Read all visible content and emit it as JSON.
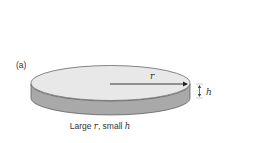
{
  "figure": {
    "panel_label": "(a)",
    "radius_label": "r",
    "height_label": "h",
    "caption": {
      "prefix": "Large ",
      "var1": "r",
      "middle": ", small ",
      "var2": "h"
    },
    "colors": {
      "top_face": "#e8e8e8",
      "side_band": "#a9a9a9",
      "outline": "#555555",
      "arrow": "#222222",
      "text": "#333333"
    }
  }
}
